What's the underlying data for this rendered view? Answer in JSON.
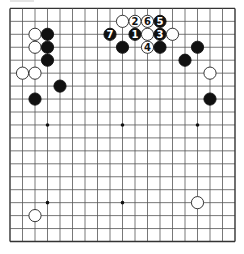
{
  "diagram": {
    "type": "go-board",
    "size": 19,
    "colors": {
      "background": "#ffffff",
      "line": "#555555",
      "border": "#333333",
      "black_stone": "#111111",
      "white_stone": "#ffffff",
      "white_outline": "#222222",
      "label_on_black": "#ffffff",
      "label_on_white": "#111111",
      "star_point": "#111111"
    },
    "star_points": [
      [
        3,
        3
      ],
      [
        9,
        3
      ],
      [
        15,
        3
      ],
      [
        3,
        9
      ],
      [
        9,
        9
      ],
      [
        15,
        9
      ],
      [
        3,
        15
      ],
      [
        9,
        15
      ],
      [
        15,
        15
      ]
    ],
    "stones": [
      {
        "color": "white",
        "col": 2,
        "row": 2,
        "label": ""
      },
      {
        "color": "black",
        "col": 3,
        "row": 2,
        "label": ""
      },
      {
        "color": "white",
        "col": 2,
        "row": 3,
        "label": ""
      },
      {
        "color": "black",
        "col": 3,
        "row": 3,
        "label": ""
      },
      {
        "color": "black",
        "col": 3,
        "row": 4,
        "label": ""
      },
      {
        "color": "white",
        "col": 1,
        "row": 5,
        "label": ""
      },
      {
        "color": "white",
        "col": 2,
        "row": 5,
        "label": ""
      },
      {
        "color": "black",
        "col": 4,
        "row": 6,
        "label": ""
      },
      {
        "color": "black",
        "col": 2,
        "row": 7,
        "label": ""
      },
      {
        "color": "white",
        "col": 9,
        "row": 1,
        "label": ""
      },
      {
        "color": "white",
        "col": 10,
        "row": 1,
        "label": "2"
      },
      {
        "color": "white",
        "col": 11,
        "row": 1,
        "label": "6"
      },
      {
        "color": "black",
        "col": 12,
        "row": 1,
        "label": "5"
      },
      {
        "color": "black",
        "col": 8,
        "row": 2,
        "label": "7"
      },
      {
        "color": "black",
        "col": 10,
        "row": 2,
        "label": "1"
      },
      {
        "color": "white",
        "col": 11,
        "row": 2,
        "label": ""
      },
      {
        "color": "black",
        "col": 12,
        "row": 2,
        "label": "3"
      },
      {
        "color": "white",
        "col": 13,
        "row": 2,
        "label": ""
      },
      {
        "color": "black",
        "col": 9,
        "row": 3,
        "label": ""
      },
      {
        "color": "white",
        "col": 11,
        "row": 3,
        "label": "4"
      },
      {
        "color": "black",
        "col": 12,
        "row": 3,
        "label": ""
      },
      {
        "color": "black",
        "col": 15,
        "row": 3,
        "label": ""
      },
      {
        "color": "black",
        "col": 14,
        "row": 4,
        "label": ""
      },
      {
        "color": "white",
        "col": 16,
        "row": 5,
        "label": ""
      },
      {
        "color": "black",
        "col": 16,
        "row": 7,
        "label": ""
      },
      {
        "color": "white",
        "col": 15,
        "row": 15,
        "label": ""
      },
      {
        "color": "white",
        "col": 2,
        "row": 16,
        "label": ""
      }
    ]
  }
}
